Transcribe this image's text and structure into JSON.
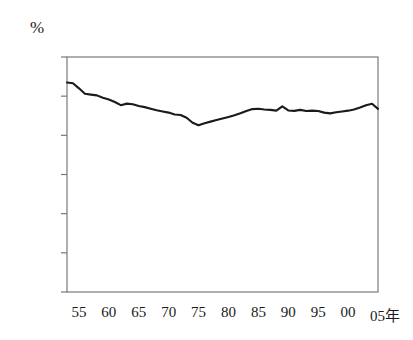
{
  "chart_data": {
    "type": "line",
    "title": "",
    "subtitle": "",
    "xlabel": "年",
    "ylabel": "%",
    "unit_label": "%",
    "axis_year_suffix": "年",
    "xlim": [
      1953,
      2005
    ],
    "ylim": [
      0.0,
      120.0
    ],
    "ytick_values": [
      0.0,
      20.0,
      40.0,
      60.0,
      80.0,
      100.0,
      120.0
    ],
    "ytick_labels": [
      "0.0",
      "20.0",
      "40.0",
      "60.0",
      "80.0",
      "100.0",
      "120.0"
    ],
    "xtick_values": [
      1955,
      1960,
      1965,
      1970,
      1975,
      1980,
      1985,
      1990,
      1995,
      2000,
      2005
    ],
    "xtick_labels": [
      "55",
      "60",
      "65",
      "70",
      "75",
      "80",
      "85",
      "90",
      "95",
      "00",
      "05年"
    ],
    "grid": false,
    "legend": false,
    "legend_position": "none",
    "line_color": "#1a1a1a",
    "line_width": 2.1,
    "frame_color": "#7a7a7a",
    "background_color": "#ffffff",
    "series": [
      {
        "name": "",
        "x": [
          1953,
          1954,
          1955,
          1956,
          1957,
          1958,
          1959,
          1960,
          1961,
          1962,
          1963,
          1964,
          1965,
          1966,
          1967,
          1968,
          1969,
          1970,
          1971,
          1972,
          1973,
          1974,
          1975,
          1976,
          1977,
          1978,
          1979,
          1980,
          1981,
          1982,
          1983,
          1984,
          1985,
          1986,
          1987,
          1988,
          1989,
          1990,
          1991,
          1992,
          1993,
          1994,
          1995,
          1996,
          1997,
          1998,
          1999,
          2000,
          2001,
          2002,
          2003,
          2004,
          2005
        ],
        "values": [
          107.0,
          106.6,
          104.0,
          101.2,
          100.8,
          100.4,
          99.2,
          98.3,
          97.0,
          95.4,
          96.2,
          95.9,
          95.0,
          94.4,
          93.6,
          92.8,
          92.2,
          91.6,
          90.6,
          90.4,
          89.0,
          86.4,
          85.2,
          86.2,
          87.0,
          87.8,
          88.6,
          89.4,
          90.3,
          91.3,
          92.4,
          93.4,
          93.6,
          93.2,
          93.0,
          92.6,
          94.8,
          92.7,
          92.5,
          93.0,
          92.4,
          92.6,
          92.4,
          91.6,
          91.2,
          91.8,
          92.2,
          92.6,
          93.2,
          94.2,
          95.4,
          96.1,
          93.5
        ]
      }
    ]
  }
}
